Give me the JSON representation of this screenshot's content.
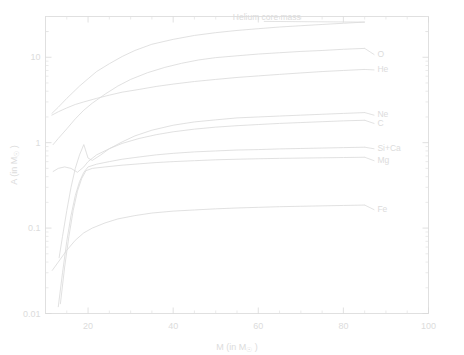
{
  "chart_data": {
    "type": "line",
    "title": "",
    "xlabel": "M (in M☉)",
    "ylabel": "A (in M☉)",
    "xlabel_main": "M  (in  M",
    "xlabel_sub": "☉",
    "xlabel_tail": " )",
    "ylabel_main": "A  (in  M",
    "ylabel_sub": "☉",
    "ylabel_tail": " )",
    "xscale": "linear",
    "yscale": "log",
    "xlim": [
      10,
      100
    ],
    "ylim": [
      0.01,
      30
    ],
    "grid": false,
    "legend_position": "inline-right-labels",
    "xticks": [
      20,
      40,
      60,
      80,
      100
    ],
    "xticklabels": [
      "20",
      "40",
      "60",
      "80",
      "100"
    ],
    "yticks": [
      10,
      1,
      0.1,
      0.01
    ],
    "yticklabels": [
      "10",
      "1",
      "0.1",
      "0.01"
    ],
    "series": [
      {
        "name": "Helium core mass",
        "label": "Helium core mass",
        "label_x": 62,
        "label_y": 27,
        "points": [
          [
            11.5,
            2.2
          ],
          [
            13,
            2.6
          ],
          [
            15,
            3.3
          ],
          [
            18,
            4.6
          ],
          [
            20,
            5.6
          ],
          [
            22,
            6.8
          ],
          [
            25,
            8.4
          ],
          [
            28,
            10.2
          ],
          [
            31,
            12.0
          ],
          [
            35,
            14.2
          ],
          [
            40,
            16.2
          ],
          [
            45,
            18.0
          ],
          [
            50,
            19.4
          ],
          [
            55,
            20.6
          ],
          [
            60,
            21.6
          ],
          [
            65,
            22.6
          ],
          [
            70,
            23.4
          ],
          [
            75,
            24.2
          ],
          [
            80,
            25.0
          ],
          [
            85,
            25.8
          ]
        ]
      },
      {
        "name": "O",
        "label": "O",
        "label_x": 88,
        "label_y": 11.0,
        "points": [
          [
            11.8,
            0.95
          ],
          [
            13,
            1.12
          ],
          [
            15,
            1.45
          ],
          [
            17,
            1.9
          ],
          [
            19,
            2.4
          ],
          [
            21,
            2.9
          ],
          [
            24,
            3.7
          ],
          [
            27,
            4.6
          ],
          [
            30,
            5.5
          ],
          [
            34,
            6.6
          ],
          [
            38,
            7.6
          ],
          [
            42,
            8.5
          ],
          [
            46,
            9.3
          ],
          [
            50,
            9.9
          ],
          [
            55,
            10.4
          ],
          [
            60,
            10.9
          ],
          [
            65,
            11.3
          ],
          [
            70,
            11.7
          ],
          [
            75,
            12.0
          ],
          [
            80,
            12.4
          ],
          [
            85,
            12.7
          ]
        ]
      },
      {
        "name": "He",
        "label": "He",
        "label_x": 88,
        "label_y": 7.3,
        "points": [
          [
            11.5,
            2.1
          ],
          [
            13,
            2.3
          ],
          [
            15,
            2.55
          ],
          [
            17,
            2.8
          ],
          [
            19,
            3.0
          ],
          [
            22,
            3.3
          ],
          [
            25,
            3.6
          ],
          [
            28,
            3.9
          ],
          [
            32,
            4.2
          ],
          [
            36,
            4.55
          ],
          [
            40,
            4.85
          ],
          [
            45,
            5.2
          ],
          [
            50,
            5.5
          ],
          [
            55,
            5.8
          ],
          [
            60,
            6.05
          ],
          [
            65,
            6.3
          ],
          [
            70,
            6.55
          ],
          [
            75,
            6.8
          ],
          [
            80,
            7.0
          ],
          [
            85,
            7.2
          ]
        ]
      },
      {
        "name": "Ne",
        "label": "Ne",
        "label_x": 88,
        "label_y": 2.15,
        "points": [
          [
            13.2,
            0.045
          ],
          [
            14,
            0.08
          ],
          [
            15,
            0.16
          ],
          [
            16,
            0.3
          ],
          [
            17,
            0.5
          ],
          [
            18,
            0.72
          ],
          [
            19,
            0.95
          ],
          [
            20,
            0.66
          ],
          [
            21,
            0.62
          ],
          [
            23,
            0.72
          ],
          [
            25,
            0.85
          ],
          [
            28,
            1.02
          ],
          [
            31,
            1.2
          ],
          [
            35,
            1.4
          ],
          [
            40,
            1.6
          ],
          [
            45,
            1.75
          ],
          [
            50,
            1.85
          ],
          [
            55,
            1.95
          ],
          [
            60,
            2.0
          ],
          [
            65,
            2.05
          ],
          [
            70,
            2.1
          ],
          [
            75,
            2.15
          ],
          [
            80,
            2.2
          ],
          [
            85,
            2.25
          ]
        ]
      },
      {
        "name": "C",
        "label": "C",
        "label_x": 88,
        "label_y": 1.72,
        "points": [
          [
            11.8,
            0.46
          ],
          [
            13,
            0.5
          ],
          [
            14.5,
            0.52
          ],
          [
            16,
            0.5
          ],
          [
            17.5,
            0.45
          ],
          [
            19,
            0.52
          ],
          [
            20,
            0.6
          ],
          [
            22,
            0.72
          ],
          [
            25,
            0.85
          ],
          [
            28,
            0.98
          ],
          [
            32,
            1.12
          ],
          [
            36,
            1.24
          ],
          [
            40,
            1.34
          ],
          [
            45,
            1.44
          ],
          [
            50,
            1.52
          ],
          [
            55,
            1.58
          ],
          [
            60,
            1.63
          ],
          [
            65,
            1.68
          ],
          [
            70,
            1.72
          ],
          [
            75,
            1.76
          ],
          [
            80,
            1.8
          ],
          [
            85,
            1.83
          ]
        ]
      },
      {
        "name": "Si+Ca",
        "label": "Si+Ca",
        "label_x": 88,
        "label_y": 0.87,
        "points": [
          [
            13.0,
            0.012
          ],
          [
            14,
            0.03
          ],
          [
            15,
            0.07
          ],
          [
            16,
            0.14
          ],
          [
            17,
            0.24
          ],
          [
            18,
            0.35
          ],
          [
            19,
            0.45
          ],
          [
            20,
            0.52
          ],
          [
            22,
            0.56
          ],
          [
            25,
            0.6
          ],
          [
            28,
            0.64
          ],
          [
            32,
            0.68
          ],
          [
            36,
            0.72
          ],
          [
            40,
            0.75
          ],
          [
            45,
            0.78
          ],
          [
            50,
            0.8
          ],
          [
            55,
            0.82
          ],
          [
            60,
            0.83
          ],
          [
            65,
            0.845
          ],
          [
            70,
            0.855
          ],
          [
            75,
            0.865
          ],
          [
            80,
            0.875
          ],
          [
            85,
            0.885
          ]
        ]
      },
      {
        "name": "Mg",
        "label": "Mg",
        "label_x": 88,
        "label_y": 0.63,
        "points": [
          [
            13.5,
            0.013
          ],
          [
            14.5,
            0.035
          ],
          [
            15.5,
            0.08
          ],
          [
            16.5,
            0.16
          ],
          [
            17.5,
            0.27
          ],
          [
            18.5,
            0.38
          ],
          [
            19.5,
            0.47
          ],
          [
            21,
            0.5
          ],
          [
            24,
            0.52
          ],
          [
            28,
            0.545
          ],
          [
            32,
            0.565
          ],
          [
            36,
            0.585
          ],
          [
            40,
            0.6
          ],
          [
            45,
            0.615
          ],
          [
            50,
            0.63
          ],
          [
            55,
            0.64
          ],
          [
            60,
            0.648
          ],
          [
            65,
            0.655
          ],
          [
            70,
            0.66
          ],
          [
            75,
            0.665
          ],
          [
            80,
            0.67
          ],
          [
            85,
            0.675
          ]
        ]
      },
      {
        "name": "Fe",
        "label": "Fe",
        "label_x": 88,
        "label_y": 0.168,
        "points": [
          [
            11.6,
            0.032
          ],
          [
            13,
            0.04
          ],
          [
            15,
            0.055
          ],
          [
            17,
            0.072
          ],
          [
            19,
            0.088
          ],
          [
            21,
            0.1
          ],
          [
            24,
            0.115
          ],
          [
            27,
            0.128
          ],
          [
            31,
            0.14
          ],
          [
            35,
            0.15
          ],
          [
            40,
            0.158
          ],
          [
            45,
            0.163
          ],
          [
            50,
            0.168
          ],
          [
            55,
            0.172
          ],
          [
            60,
            0.175
          ],
          [
            65,
            0.178
          ],
          [
            70,
            0.18
          ],
          [
            75,
            0.182
          ],
          [
            80,
            0.184
          ],
          [
            85,
            0.186
          ]
        ]
      }
    ]
  }
}
